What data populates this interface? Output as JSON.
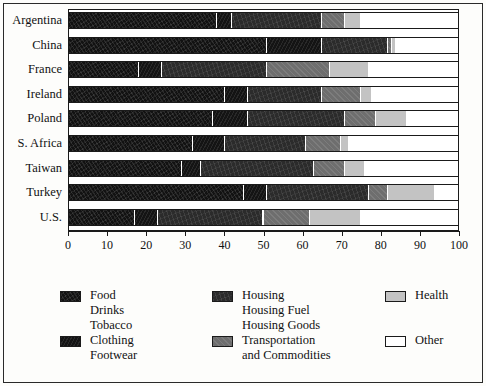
{
  "chart_data": {
    "type": "bar",
    "orientation": "horizontal",
    "stacked": true,
    "title": "",
    "subtitle": "",
    "xlabel": "",
    "ylabel": "",
    "xlim": [
      0,
      100
    ],
    "ylim": null,
    "grid": false,
    "legend_position": "bottom",
    "xticks": [
      0,
      10,
      20,
      30,
      40,
      50,
      60,
      70,
      80,
      90,
      100
    ],
    "xtick_labels": [
      "0",
      "10",
      "20",
      "30",
      "40",
      "50",
      "60",
      "70",
      "80",
      "90",
      "100"
    ],
    "categories": [
      "Argentina",
      "China",
      "France",
      "Ireland",
      "Poland",
      "S. Africa",
      "Taiwan",
      "Turkey",
      "U.S."
    ],
    "series": [
      {
        "name": "Food Drinks Tobacco",
        "key": "food",
        "color": "#121212",
        "values": [
          38,
          51,
          18,
          40,
          37,
          32,
          29,
          45,
          17
        ]
      },
      {
        "name": "Clothing Footwear",
        "key": "clothing",
        "color": "#141414",
        "values": [
          4,
          14,
          6,
          6,
          9,
          8,
          5,
          6,
          6
        ]
      },
      {
        "name": "Housing Housing Fuel Housing Goods",
        "key": "housing",
        "color": "#2b2b2b",
        "values": [
          23,
          17,
          27,
          19,
          25,
          21,
          29,
          26,
          27
        ]
      },
      {
        "name": "Transportation and Commodities",
        "key": "transportation",
        "color": "#6e6e6e",
        "values": [
          6,
          1,
          16,
          10,
          8,
          9,
          8,
          5,
          12
        ]
      },
      {
        "name": "Health",
        "key": "health",
        "color": "#c3c3c3",
        "values": [
          4,
          1,
          10,
          3,
          8,
          2,
          5,
          12,
          13
        ]
      },
      {
        "name": "Other",
        "key": "other",
        "color": "#ffffff",
        "values": [
          25,
          16,
          23,
          22,
          13,
          28,
          24,
          6,
          25
        ]
      }
    ]
  },
  "legend": {
    "entries": [
      {
        "name": "food",
        "lines": [
          "Food",
          "Drinks",
          "Tobacco"
        ],
        "color": "#121212"
      },
      {
        "name": "clothing",
        "lines": [
          "Clothing",
          "Footwear"
        ],
        "color": "#141414"
      },
      {
        "name": "housing",
        "lines": [
          "Housing",
          "Housing Fuel",
          "Housing Goods"
        ],
        "color": "#2b2b2b"
      },
      {
        "name": "transportation",
        "lines": [
          "Transportation",
          "and Commodities"
        ],
        "color": "#6e6e6e"
      },
      {
        "name": "health",
        "lines": [
          "Health"
        ],
        "color": "#c3c3c3"
      },
      {
        "name": "other",
        "lines": [
          "Other"
        ],
        "color": "#ffffff"
      }
    ]
  }
}
